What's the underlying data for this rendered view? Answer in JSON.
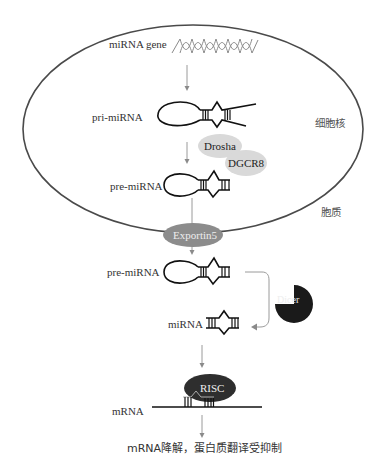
{
  "figure": {
    "compartments": {
      "nucleus_label": "细胞核",
      "cytoplasm_label": "胞质"
    },
    "labels": {
      "mirna_gene": "miRNA gene",
      "pri_mirna": "pri-miRNA",
      "pre_mirna_nucleus": "pre-miRNA",
      "pre_mirna_cytoplasm": "pre-miRNA",
      "mirna": "miRNA",
      "mrna": "mRNA",
      "outcome": "mRNA降解，蛋白质翻译受抑制"
    },
    "proteins": {
      "drosha": "Drosha",
      "dgcr8": "DGCR8",
      "exportin": "Exportin5",
      "dicer": "Dicer",
      "risc": "RISC"
    },
    "colors": {
      "membrane": "#4a4a4a",
      "drosha_fill": "#d9d9d9",
      "exportin_fill": "#8c8c8c",
      "dicer_fill": "#1a1a1a",
      "risc_fill": "#2e2e2e",
      "arrow": "#9a9a9a"
    }
  }
}
